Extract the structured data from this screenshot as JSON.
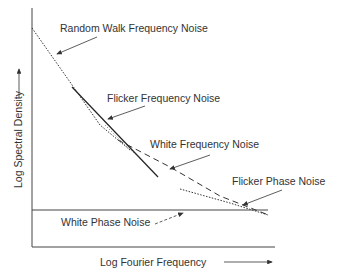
{
  "diagram": {
    "y_axis_label": "Log Spectral Density",
    "x_axis_label": "Log Fourier Frequency",
    "labels": {
      "random_walk": "Random Walk Frequency Noise",
      "flicker_frequency": "Flicker Frequency Noise",
      "white_frequency": "White Frequency Noise",
      "flicker_phase": "Flicker Phase  Noise",
      "white_phase": "White Phase Noise"
    },
    "line_color": "#333333"
  }
}
